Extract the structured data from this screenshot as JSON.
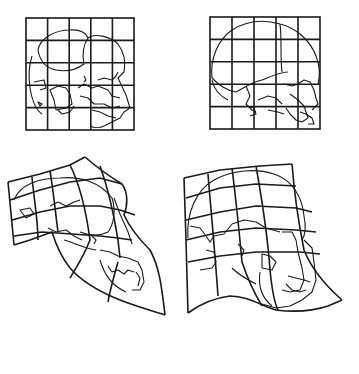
{
  "figure": {
    "panels": [
      {
        "id": "chimp-juvenile",
        "position": "top-left",
        "description": "Juvenile chimpanzee skull on square Cartesian grid",
        "grid": "5x5"
      },
      {
        "id": "human-infant",
        "position": "top-right",
        "description": "Infant human skull on square Cartesian grid",
        "grid": "5x5"
      },
      {
        "id": "chimp-adult",
        "position": "bottom-left",
        "description": "Adult chimpanzee skull on deformed transformation grid"
      },
      {
        "id": "human-adult",
        "position": "bottom-right",
        "description": "Adult human skull on deformed transformation grid"
      }
    ],
    "colors": {
      "line": "#1a1a1a",
      "background": "#ffffff"
    }
  }
}
